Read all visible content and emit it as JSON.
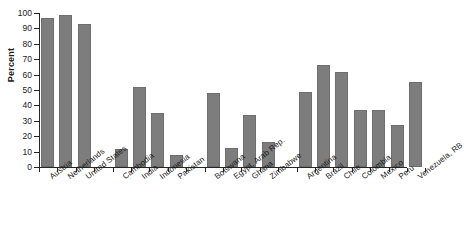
{
  "chart_data": {
    "type": "bar",
    "title": "",
    "subtitle": "",
    "xlabel": "",
    "ylabel": "Percent",
    "ylim": [
      0,
      100
    ],
    "ytick_step": 10,
    "yticks": [
      0,
      10,
      20,
      30,
      40,
      50,
      60,
      70,
      80,
      90,
      100
    ],
    "grid": false,
    "legend": null,
    "bar_color": "#7d7d7d",
    "axis_color": "#262626",
    "categories": [
      "Austria",
      "Netherlands",
      "United States",
      "Cambodia",
      "India",
      "Indonesia",
      "Pakistan",
      "Botswana",
      "Egypt, Arab Rep.",
      "Ghana",
      "Zimbabwe",
      "Argentina",
      "Brazil",
      "Chile",
      "Colombia",
      "Mexico",
      "Peru",
      "Venezuela, RB"
    ],
    "values": [
      96.5,
      99,
      93,
      12,
      52,
      35,
      8,
      48,
      12.5,
      34,
      16,
      49,
      66.5,
      62,
      37,
      37,
      27.5,
      55
    ],
    "groups": [
      {
        "name": "High income",
        "categories": [
          "Austria",
          "Netherlands",
          "United States"
        ]
      },
      {
        "name": "Asia",
        "categories": [
          "Cambodia",
          "India",
          "Indonesia",
          "Pakistan"
        ]
      },
      {
        "name": "Africa",
        "categories": [
          "Botswana",
          "Egypt, Arab Rep.",
          "Ghana",
          "Zimbabwe"
        ]
      },
      {
        "name": "Latin America",
        "categories": [
          "Argentina",
          "Brazil",
          "Chile",
          "Colombia",
          "Mexico",
          "Peru",
          "Venezuela, RB"
        ]
      }
    ]
  }
}
